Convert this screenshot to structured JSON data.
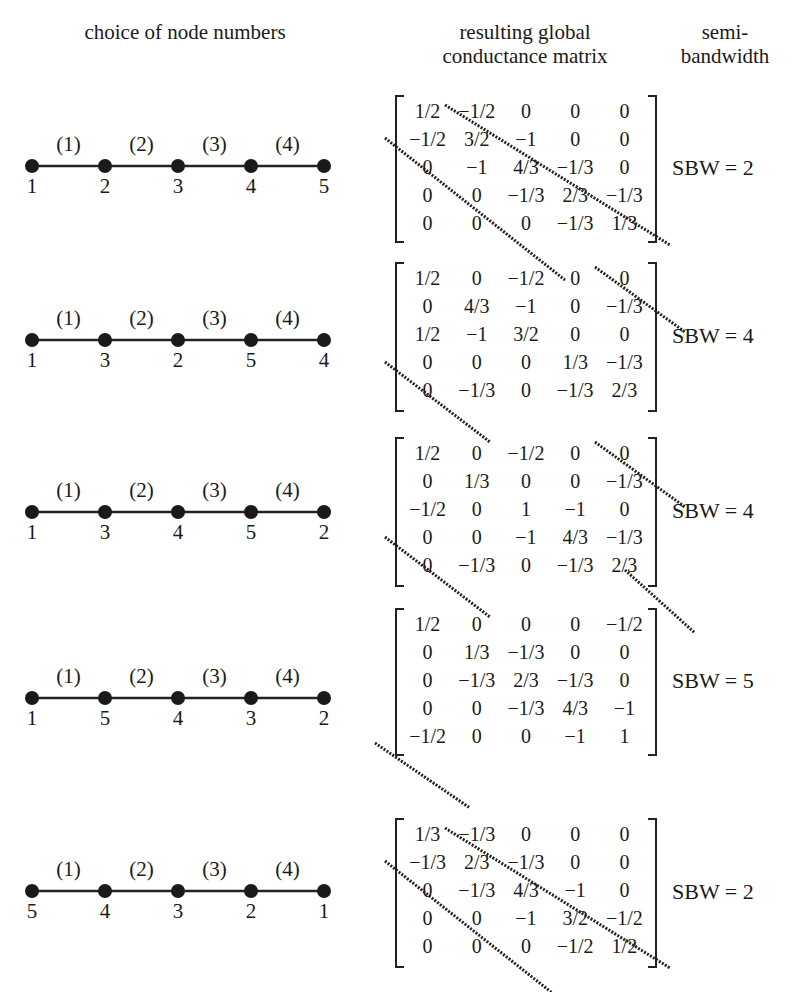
{
  "headers": {
    "left": "choice of node numbers",
    "middle": "resulting global conductance matrix",
    "right": "semi-bandwidth"
  },
  "element_labels": [
    "(1)",
    "(2)",
    "(3)",
    "(4)"
  ],
  "cases": [
    {
      "node_numbers": [
        "1",
        "2",
        "3",
        "4",
        "5"
      ],
      "matrix": [
        [
          "1/2",
          "−1/2",
          "0",
          "0",
          "0"
        ],
        [
          "−1/2",
          "3/2",
          "−1",
          "0",
          "0"
        ],
        [
          "0",
          "−1",
          "4/3",
          "−1/3",
          "0"
        ],
        [
          "0",
          "0",
          "−1/3",
          "2/3",
          "−1/3"
        ],
        [
          "0",
          "0",
          "0",
          "−1/3",
          "1/3"
        ]
      ],
      "sbw": "SBW = 2"
    },
    {
      "node_numbers": [
        "1",
        "3",
        "2",
        "5",
        "4"
      ],
      "matrix": [
        [
          "1/2",
          "0",
          "−1/2",
          "0",
          "0"
        ],
        [
          "0",
          "4/3",
          "−1",
          "0",
          "−1/3"
        ],
        [
          "1/2",
          "−1",
          "3/2",
          "0",
          "0"
        ],
        [
          "0",
          "0",
          "0",
          "1/3",
          "−1/3"
        ],
        [
          "0",
          "−1/3",
          "0",
          "−1/3",
          "2/3"
        ]
      ],
      "sbw": "SBW = 4"
    },
    {
      "node_numbers": [
        "1",
        "3",
        "4",
        "5",
        "2"
      ],
      "matrix": [
        [
          "1/2",
          "0",
          "−1/2",
          "0",
          "0"
        ],
        [
          "0",
          "1/3",
          "0",
          "0",
          "−1/3"
        ],
        [
          "−1/2",
          "0",
          "1",
          "−1",
          "0"
        ],
        [
          "0",
          "0",
          "−1",
          "4/3",
          "−1/3"
        ],
        [
          "0",
          "−1/3",
          "0",
          "−1/3",
          "2/3"
        ]
      ],
      "sbw": "SBW = 4"
    },
    {
      "node_numbers": [
        "1",
        "5",
        "4",
        "3",
        "2"
      ],
      "matrix": [
        [
          "1/2",
          "0",
          "0",
          "0",
          "−1/2"
        ],
        [
          "0",
          "1/3",
          "−1/3",
          "0",
          "0"
        ],
        [
          "0",
          "−1/3",
          "2/3",
          "−1/3",
          "0"
        ],
        [
          "0",
          "0",
          "−1/3",
          "4/3",
          "−1"
        ],
        [
          "−1/2",
          "0",
          "0",
          "−1",
          "1"
        ]
      ],
      "sbw": "SBW = 5"
    },
    {
      "node_numbers": [
        "5",
        "4",
        "3",
        "2",
        "1"
      ],
      "matrix": [
        [
          "1/3",
          "−1/3",
          "0",
          "0",
          "0"
        ],
        [
          "−1/3",
          "2/3",
          "−1/3",
          "0",
          "0"
        ],
        [
          "0",
          "−1/3",
          "4/3",
          "−1",
          "0"
        ],
        [
          "0",
          "0",
          "−1",
          "3/2",
          "−1/2"
        ],
        [
          "0",
          "0",
          "0",
          "−1/2",
          "1/2"
        ]
      ],
      "sbw": "SBW = 2"
    }
  ]
}
